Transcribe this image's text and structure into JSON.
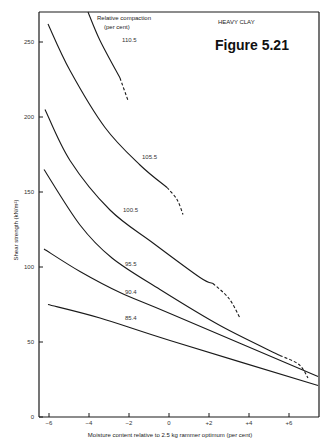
{
  "figure": {
    "number_label": "Figure 5.21",
    "soil_label": "HEAVY CLAY",
    "legend_title_line1": "Relative compaction",
    "legend_title_line2": "(per cent)"
  },
  "chart_data": {
    "type": "line",
    "title": "Figure 5.21",
    "subtitle": "HEAVY CLAY",
    "xlabel": "Moisture content relative to 2.5 kg rammer optimum (per cent)",
    "ylabel": "Shear strength (kN/m²)",
    "xlim": [
      -6.5,
      7.5
    ],
    "ylim": [
      0,
      270
    ],
    "xticks": [
      -6,
      -4,
      -2,
      0,
      2,
      4,
      6
    ],
    "xtick_labels": [
      "−6",
      "−4",
      "−2",
      "0",
      "+2",
      "+4",
      "+6"
    ],
    "yticks": [
      0,
      50,
      100,
      150,
      200,
      250
    ],
    "ytick_labels": [
      "0",
      "50",
      "100",
      "150",
      "200",
      "250"
    ],
    "grid": false,
    "legend_title": "Relative compaction (per cent)",
    "series": [
      {
        "name": "110.5",
        "solid": [
          [
            -4.05,
            270
          ],
          [
            -3.45,
            251
          ],
          [
            -2.45,
            226
          ]
        ],
        "dashed": [
          [
            -2.45,
            226
          ],
          [
            -2.05,
            211
          ]
        ]
      },
      {
        "name": "105.5",
        "solid": [
          [
            -6.05,
            262
          ],
          [
            -4.95,
            231
          ],
          [
            -3.2,
            193
          ],
          [
            -1.45,
            168
          ],
          [
            -0.1,
            153
          ]
        ],
        "dashed": [
          [
            -0.1,
            153
          ],
          [
            0.4,
            145
          ],
          [
            0.7,
            135
          ]
        ]
      },
      {
        "name": "100.5",
        "solid": [
          [
            -6.2,
            205
          ],
          [
            -4.95,
            171
          ],
          [
            -2.95,
            138
          ],
          [
            -0.8,
            116
          ],
          [
            1.55,
            93
          ],
          [
            2.2,
            89
          ]
        ],
        "dashed": [
          [
            2.2,
            89
          ],
          [
            3.0,
            79
          ],
          [
            3.55,
            66
          ]
        ]
      },
      {
        "name": "95.5",
        "solid": [
          [
            -6.25,
            165
          ],
          [
            -4.45,
            128
          ],
          [
            -2.85,
            106
          ],
          [
            -0.45,
            85
          ],
          [
            2.55,
            61
          ],
          [
            5.55,
            41
          ]
        ],
        "dashed": [
          [
            5.55,
            41
          ],
          [
            6.5,
            35
          ],
          [
            6.95,
            26
          ]
        ]
      },
      {
        "name": "90.4",
        "solid": [
          [
            -6.25,
            112
          ],
          [
            -4.45,
            97
          ],
          [
            -2.45,
            83
          ],
          [
            0.05,
            69
          ],
          [
            7.45,
            27
          ]
        ],
        "dashed": []
      },
      {
        "name": "85.4",
        "solid": [
          [
            -6.05,
            75
          ],
          [
            -3.45,
            66
          ],
          [
            0.05,
            51
          ],
          [
            7.45,
            21
          ]
        ],
        "dashed": []
      }
    ],
    "curve_labels": [
      {
        "text": "110.5",
        "x": -2.35,
        "y": 250
      },
      {
        "text": "105.5",
        "x": -1.35,
        "y": 172
      },
      {
        "text": "100.5",
        "x": -2.3,
        "y": 137
      },
      {
        "text": "95.5",
        "x": -2.2,
        "y": 101
      },
      {
        "text": "90.4",
        "x": -2.2,
        "y": 82
      },
      {
        "text": "85.4",
        "x": -2.2,
        "y": 65
      }
    ]
  }
}
